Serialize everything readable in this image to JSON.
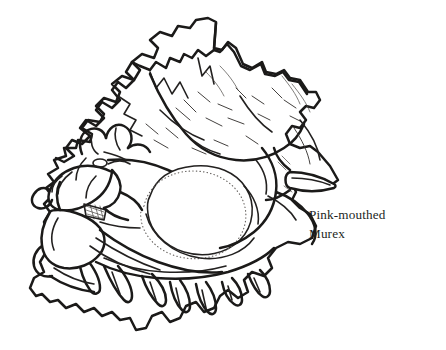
{
  "figure": {
    "kind": "line-drawing",
    "common_name": "Pink-mouthed Murex",
    "caption_lines": [
      "Pink-mouthed",
      "Murex"
    ],
    "caption_full": "Pink-mouthed Murex",
    "background_color": "#ffffff",
    "ink_color": "#1b1a19",
    "canvas": {
      "width": 446,
      "height": 350
    },
    "parts": {
      "spire_label": "spire",
      "body_whorl_label": "body whorl",
      "aperture_label": "aperture",
      "siphonal_canal_label": "siphonal canal",
      "frond_label": "frondose varix",
      "spine_label": "spine"
    }
  }
}
